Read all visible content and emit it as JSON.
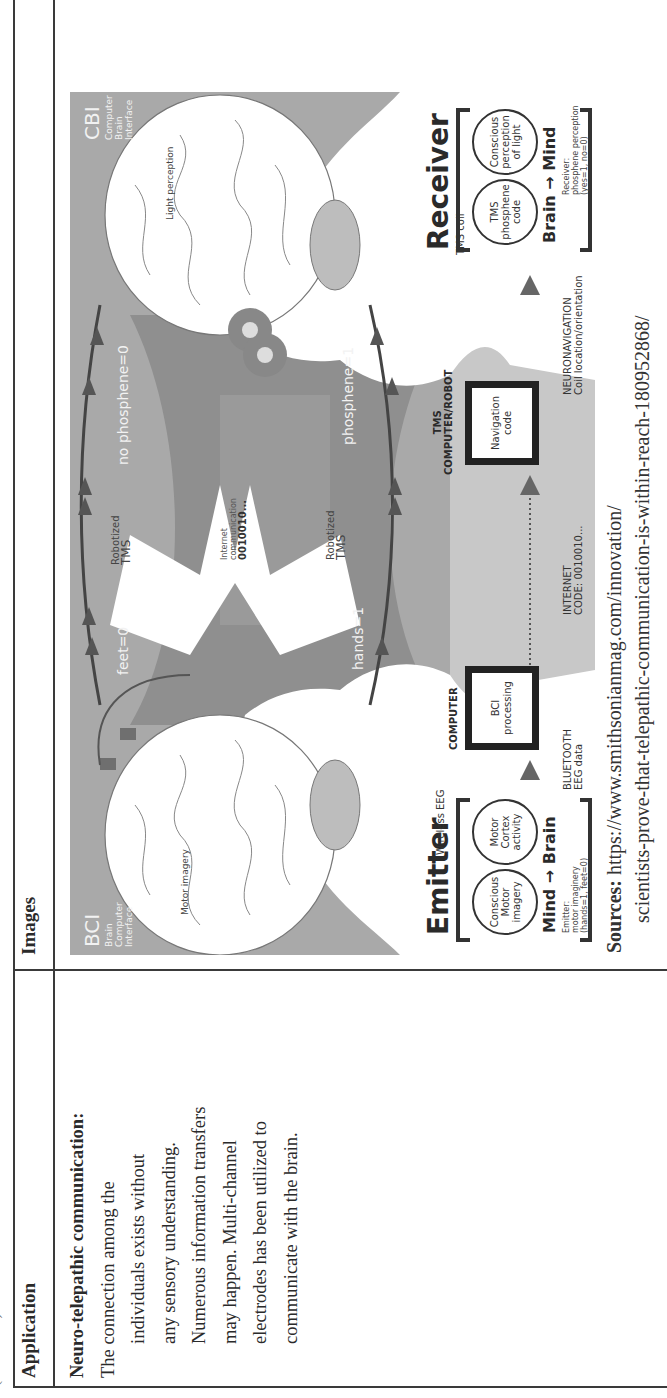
{
  "page": {
    "continued_label": "(Continued)"
  },
  "table": {
    "headers": {
      "application": "Application",
      "images": "Images"
    },
    "row": {
      "application_title": "Neuro-telepathic communication:",
      "application_lines": [
        "The connection among the",
        "individuals exists without",
        "any sensory understanding.",
        "Numerous information transfers",
        "may happen. Multi-channel",
        "electrodes has been utilized to",
        "communicate with the brain."
      ],
      "sources_label": "Sources:",
      "sources_line1": "https://www.smithsonianmag.com/innovation/",
      "sources_line2": "scientists-prove-that-telepathic-communication-is-within-reach-180952868/"
    }
  },
  "figure": {
    "bci_title": "BCI",
    "bci_sub": [
      "Brain",
      "Computer",
      "Interface"
    ],
    "cbi_title": "CBI",
    "cbi_sub": [
      "Computer",
      "Brain",
      "Interface"
    ],
    "motor_imagery": "Motor imagery",
    "light_perception": "Light perception",
    "feet": "feet=0",
    "hands": "hands=1",
    "robotized_tms_1": [
      "Robotized",
      "TMS"
    ],
    "robotized_tms_2": [
      "Robotized",
      "TMS"
    ],
    "no_phosphene": "no phosphene=0",
    "phosphene": "phosphene=1",
    "internet_comm": [
      "Internet",
      "communication"
    ],
    "internet_code": "0010010...",
    "emitter": {
      "title": "Emitter",
      "device": "Wireless EEG",
      "circle1": [
        "Conscious",
        "Motor",
        "imagery"
      ],
      "circle2": [
        "Motor",
        "Cortex",
        "activity"
      ],
      "flow": "Mind → Brain",
      "note": [
        "Emitter:",
        "motor imaginery",
        "(hands=1, feet=0)"
      ]
    },
    "computer": {
      "title": "COMPUTER",
      "box": [
        "BCI",
        "processing"
      ],
      "link": [
        "BLUETOOTH",
        "EEG data"
      ]
    },
    "internet": {
      "link": [
        "INTERNET",
        "CODE: 0010010..."
      ]
    },
    "tms_computer": {
      "title": [
        "TMS",
        "COMPUTER/ROBOT"
      ],
      "box": [
        "Navigation",
        "code"
      ],
      "link": [
        "NEURONAVIGATION",
        "Coil location/orientation"
      ]
    },
    "receiver": {
      "title": "Receiver",
      "device": "TMS coil",
      "circle1": [
        "TMS",
        "phosphene",
        "code"
      ],
      "circle2": [
        "Conscious",
        "perception",
        "of light"
      ],
      "flow": "Brain → Mind",
      "note": [
        "Receiver:",
        "phosphene perception",
        "(yes=1, no=0)"
      ]
    }
  }
}
